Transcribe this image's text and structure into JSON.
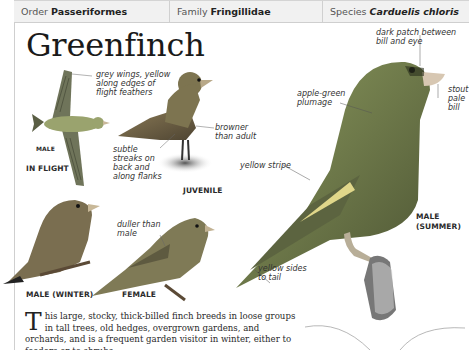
{
  "taxonomy": {
    "order_label": "Order",
    "order_value": "Passeriformes",
    "family_label": "Family",
    "family_value": "Fringillidae",
    "species_label": "Species",
    "species_value": "Carduelis chloris"
  },
  "title": "Greenfinch",
  "annotations": {
    "flight_wings": "grey wings, yellow along edges of flight feathers",
    "juvenile_streaks": "subtle streaks on back and along flanks",
    "juvenile_browner": "browner than adult",
    "dark_patch": "dark patch between bill and eye",
    "apple_green": "apple-green plumage",
    "stout_bill": "stout pale bill",
    "yellow_stripe": "yellow stripe",
    "yellow_sides": "yellow sides to tail",
    "female_duller": "duller than male"
  },
  "labels": {
    "male_small": "MALE",
    "in_flight": "IN FLIGHT",
    "juvenile": "JUVENILE",
    "male_summer_1": "MALE",
    "male_summer_2": "(SUMMER)",
    "male_winter": "MALE (WINTER)",
    "female": "FEMALE"
  },
  "body": {
    "dropcap": "T",
    "text": "his large, stocky, thick-billed finch breeds in loose groups in tall trees, old hedges, overgrown gardens, and orchards, and is a frequent garden visitor in winter, either to feeders or to shrubs"
  },
  "colors": {
    "header_bg": "#f1f1f1",
    "bird_green": "#7a8a4e",
    "bird_dark": "#4d5534",
    "yellow": "#d8d070"
  }
}
